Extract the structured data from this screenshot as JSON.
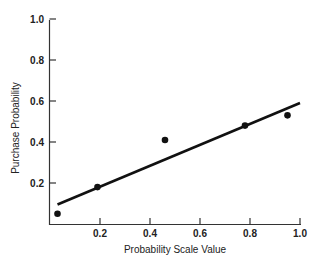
{
  "chart_data": {
    "type": "scatter",
    "title": "",
    "xlabel": "Probability Scale Value",
    "ylabel": "Purchase Probability",
    "xlim": [
      0,
      1.0
    ],
    "ylim": [
      0,
      1.0
    ],
    "xticks": [
      "0.2",
      "0.4",
      "0.6",
      "0.8",
      "1.0"
    ],
    "yticks": [
      "0.2",
      "0.4",
      "0.6",
      "0.8",
      "1.0"
    ],
    "grid": false,
    "legend": null,
    "series": [
      {
        "name": "observed",
        "type": "scatter",
        "points": [
          {
            "x": 0.03,
            "y": 0.05
          },
          {
            "x": 0.19,
            "y": 0.18
          },
          {
            "x": 0.46,
            "y": 0.41
          },
          {
            "x": 0.78,
            "y": 0.48
          },
          {
            "x": 0.95,
            "y": 0.53
          }
        ]
      },
      {
        "name": "fitted line",
        "type": "line",
        "points": [
          {
            "x": 0.03,
            "y": 0.095
          },
          {
            "x": 1.0,
            "y": 0.59
          }
        ]
      }
    ]
  },
  "colors": {
    "ink": "#111111",
    "background": "#ffffff"
  }
}
